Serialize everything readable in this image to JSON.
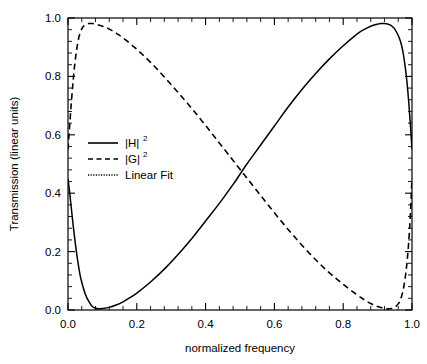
{
  "chart_data": {
    "type": "line",
    "title": "",
    "xlabel": "normalized frequency",
    "ylabel": "Transmission (linear units)",
    "xlim": [
      0.0,
      1.0
    ],
    "ylim": [
      0.0,
      1.0
    ],
    "xticks": [
      "0.0",
      "0.2",
      "0.4",
      "0.6",
      "0.8",
      "1.0"
    ],
    "xtick_values": [
      0.0,
      0.2,
      0.4,
      0.6,
      0.8,
      1.0
    ],
    "yticks": [
      "0.0",
      "0.2",
      "0.4",
      "0.6",
      "0.8",
      "1.0"
    ],
    "ytick_values": [
      0.0,
      0.2,
      0.4,
      0.6,
      0.8,
      1.0
    ],
    "grid": false,
    "legend_position": "upper left",
    "minor_ticks_per_interval": 4,
    "series": [
      {
        "name": "|H|^2",
        "label_base": "|H|",
        "label_exponent": "2",
        "style": "solid",
        "color": "#000000",
        "x": [
          0.0,
          0.005,
          0.01,
          0.015,
          0.02,
          0.025,
          0.03,
          0.035,
          0.04,
          0.05,
          0.06,
          0.07,
          0.08,
          0.09,
          0.1,
          0.12,
          0.14,
          0.16,
          0.18,
          0.2,
          0.24,
          0.28,
          0.32,
          0.36,
          0.4,
          0.44,
          0.48,
          0.5,
          0.52,
          0.56,
          0.6,
          0.64,
          0.68,
          0.72,
          0.76,
          0.8,
          0.84,
          0.86,
          0.88,
          0.9,
          0.91,
          0.92,
          0.93,
          0.94,
          0.95,
          0.96,
          0.965,
          0.97,
          0.975,
          0.98,
          0.985,
          0.99,
          0.995,
          1.0
        ],
        "y": [
          0.45,
          0.4,
          0.345,
          0.29,
          0.24,
          0.195,
          0.155,
          0.12,
          0.095,
          0.055,
          0.03,
          0.013,
          0.006,
          0.004,
          0.005,
          0.009,
          0.017,
          0.028,
          0.042,
          0.058,
          0.096,
          0.14,
          0.19,
          0.245,
          0.305,
          0.365,
          0.43,
          0.465,
          0.5,
          0.565,
          0.63,
          0.695,
          0.755,
          0.81,
          0.86,
          0.905,
          0.945,
          0.96,
          0.972,
          0.979,
          0.981,
          0.981,
          0.979,
          0.974,
          0.962,
          0.94,
          0.925,
          0.905,
          0.875,
          0.835,
          0.785,
          0.72,
          0.64,
          0.55
        ]
      },
      {
        "name": "|G|^2",
        "label_base": "|G|",
        "label_exponent": "2",
        "style": "dashed",
        "color": "#000000",
        "x": [
          0.0,
          0.005,
          0.01,
          0.015,
          0.02,
          0.025,
          0.03,
          0.035,
          0.04,
          0.045,
          0.05,
          0.06,
          0.07,
          0.08,
          0.1,
          0.12,
          0.14,
          0.16,
          0.2,
          0.24,
          0.28,
          0.32,
          0.36,
          0.4,
          0.44,
          0.48,
          0.5,
          0.52,
          0.56,
          0.6,
          0.64,
          0.68,
          0.72,
          0.76,
          0.8,
          0.84,
          0.86,
          0.88,
          0.9,
          0.92,
          0.93,
          0.94,
          0.95,
          0.96,
          0.965,
          0.97,
          0.975,
          0.98,
          0.985,
          0.99,
          0.995,
          1.0
        ],
        "y": [
          0.55,
          0.635,
          0.715,
          0.785,
          0.845,
          0.89,
          0.925,
          0.948,
          0.963,
          0.972,
          0.977,
          0.981,
          0.981,
          0.979,
          0.972,
          0.962,
          0.948,
          0.932,
          0.893,
          0.848,
          0.798,
          0.745,
          0.69,
          0.632,
          0.572,
          0.512,
          0.482,
          0.452,
          0.392,
          0.333,
          0.276,
          0.222,
          0.172,
          0.127,
          0.088,
          0.052,
          0.036,
          0.022,
          0.012,
          0.005,
          0.004,
          0.005,
          0.009,
          0.021,
          0.032,
          0.048,
          0.072,
          0.108,
          0.158,
          0.225,
          0.32,
          0.45
        ]
      },
      {
        "name": "Linear Fit",
        "label_base": "Linear Fit",
        "label_exponent": "",
        "style": "dotted",
        "color": "#000000",
        "x": [],
        "y": []
      }
    ]
  },
  "legend": {
    "entries": [
      {
        "label": "|H|",
        "exponent": "2",
        "style": "solid"
      },
      {
        "label": "|G|",
        "exponent": "2",
        "style": "dashed"
      },
      {
        "label": "Linear Fit",
        "exponent": "",
        "style": "dotted"
      }
    ]
  }
}
